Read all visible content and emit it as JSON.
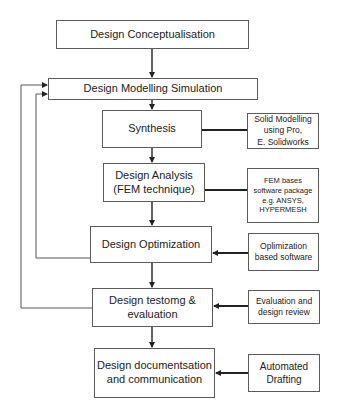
{
  "diagram": {
    "type": "flowchart",
    "main_steps": [
      {
        "id": "conceptualisation",
        "label": "Design Conceptualisation"
      },
      {
        "id": "modelling-simulation",
        "label": "Design Modelling Simulation"
      },
      {
        "id": "synthesis",
        "label": "Synthesis"
      },
      {
        "id": "analysis",
        "label": "Design Analysis\n(FEM technique)"
      },
      {
        "id": "optimization",
        "label": "Design Optimization"
      },
      {
        "id": "testing",
        "label": "Design testomg &\nevaluation"
      },
      {
        "id": "documentation",
        "label": "Design documentsation\nand communication"
      }
    ],
    "tools": [
      {
        "id": "solid-modelling",
        "target": "synthesis",
        "label": "Solid Modelling\nusing Pro,\nE.  Solidworks"
      },
      {
        "id": "fem-software",
        "target": "analysis",
        "label": "FEM bases\nsoftware package\ne.g. ANSYS,\nHYPERMESH"
      },
      {
        "id": "optimization-software",
        "target": "optimization",
        "label": "Oplimization\nbased software"
      },
      {
        "id": "evaluation-review",
        "target": "testing",
        "label": "Evaluation and\ndesign review"
      },
      {
        "id": "automated-drafting",
        "target": "documentation",
        "label": "Automated\nDrafting"
      }
    ],
    "feedback_loops": [
      {
        "from": "optimization",
        "to": "modelling-simulation"
      },
      {
        "from": "testing",
        "to": "modelling-simulation"
      }
    ],
    "colors": {
      "box_border": "#5a5a5a",
      "line": "#333333",
      "background": "#ffffff"
    }
  }
}
